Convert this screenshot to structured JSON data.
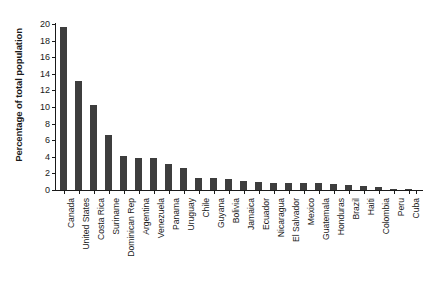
{
  "chart_data": {
    "type": "bar",
    "title": "",
    "xlabel": "",
    "ylabel": "Percentage of total population",
    "ylim": [
      0,
      20
    ],
    "ytick_step": 2,
    "yticks": [
      0,
      2,
      4,
      6,
      8,
      10,
      12,
      14,
      16,
      18,
      20
    ],
    "grid": false,
    "legend": false,
    "bar_color": "#3d3d3d",
    "axis_color": "#1a1a1a",
    "background_color": "#ffffff",
    "categories": [
      "Canada",
      "United States",
      "Costa Rica",
      "Suriname",
      "Dominican Rep",
      "Argentina",
      "Venezuela",
      "Panama",
      "Uruguay",
      "Chile",
      "Guyana",
      "Bolivia",
      "Jamaica",
      "Ecuador",
      "Nicaragua",
      "El Salvador",
      "Mexico",
      "Guatemala",
      "Honduras",
      "Brazil",
      "Haiti",
      "Colombia",
      "Peru",
      "Cuba"
    ],
    "values": [
      19.6,
      13.1,
      10.3,
      6.6,
      4.1,
      3.8,
      3.8,
      3.1,
      2.6,
      1.5,
      1.4,
      1.3,
      1.1,
      1.0,
      0.9,
      0.9,
      0.8,
      0.8,
      0.7,
      0.6,
      0.5,
      0.4,
      0.15,
      0.1
    ]
  }
}
